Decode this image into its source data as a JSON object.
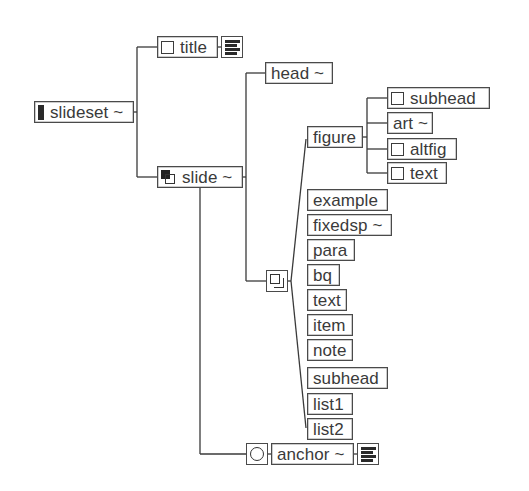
{
  "diagram": {
    "type": "element-structure-tree",
    "line_color": "#3a3a3a",
    "root": {
      "label": "slideset ~",
      "icon": "filled-bar-icon",
      "children": [
        {
          "label": "title",
          "icon": "empty-box-icon",
          "suffix_icon": "text-lines-icon"
        },
        {
          "label": "slide ~",
          "icon": "sequence-icon",
          "children": [
            {
              "label": "head ~"
            },
            {
              "group": "choice",
              "icon": "choice-icon",
              "children": [
                {
                  "label": "figure",
                  "children": [
                    {
                      "label": "subhead",
                      "icon": "empty-box-icon"
                    },
                    {
                      "label": "art ~"
                    },
                    {
                      "label": "altfig",
                      "icon": "empty-box-icon"
                    },
                    {
                      "label": "text",
                      "icon": "empty-box-icon"
                    }
                  ]
                },
                {
                  "label": "example"
                },
                {
                  "label": "fixedsp ~"
                },
                {
                  "label": "para"
                },
                {
                  "label": "bq"
                },
                {
                  "label": "text"
                },
                {
                  "label": "item"
                },
                {
                  "label": "note"
                },
                {
                  "label": "subhead"
                },
                {
                  "label": "list1"
                },
                {
                  "label": "list2"
                }
              ]
            },
            {
              "label": "anchor ~",
              "prefix_icon": "circle-icon",
              "suffix_icon": "text-lines-icon"
            }
          ]
        }
      ]
    }
  },
  "nodes": {
    "slideset": "slideset ~",
    "title": "title",
    "slide": "slide ~",
    "head": "head ~",
    "figure": "figure",
    "fig_subhead": "subhead",
    "fig_art": "art ~",
    "fig_altfig": "altfig",
    "fig_text": "text",
    "example": "example",
    "fixedsp": "fixedsp ~",
    "para": "para",
    "bq": "bq",
    "text": "text",
    "item": "item",
    "note": "note",
    "subhead": "subhead",
    "list1": "list1",
    "list2": "list2",
    "anchor": "anchor ~"
  }
}
